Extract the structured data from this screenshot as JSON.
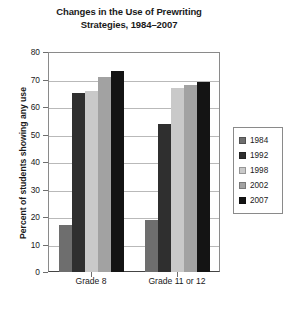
{
  "chart_data": {
    "type": "bar",
    "title": "Changes in the Use of Prewriting Strategies, 1984–2007",
    "title_line1": "Changes in the Use of Prewriting",
    "title_line2": "Strategies, 1984–2007",
    "xlabel": "",
    "ylabel": "Percent of students showing any use",
    "categories": [
      "Grade 8",
      "Grade 11 or 12"
    ],
    "ylim": [
      0,
      80
    ],
    "yticks": [
      0,
      10,
      20,
      30,
      40,
      50,
      60,
      70,
      80
    ],
    "grid": true,
    "legend_position": "right",
    "series": [
      {
        "name": "1984",
        "color": "#6e6e6e",
        "values": [
          17,
          19
        ]
      },
      {
        "name": "1992",
        "color": "#2f2f2f",
        "values": [
          65,
          54
        ]
      },
      {
        "name": "1998",
        "color": "#c9c9c9",
        "values": [
          66,
          67
        ]
      },
      {
        "name": "2002",
        "color": "#a2a2a2",
        "values": [
          71,
          68
        ]
      },
      {
        "name": "2007",
        "color": "#141414",
        "values": [
          73,
          69
        ]
      }
    ]
  }
}
